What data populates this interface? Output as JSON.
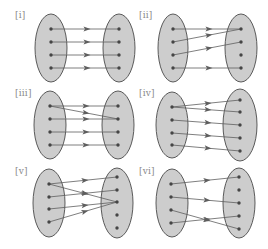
{
  "colors": {
    "background": "#ffffff",
    "ellipse_fill": "#cdcdcd",
    "ellipse_stroke": "#5a5a5a",
    "dot": "#454545",
    "line": "#5e5e5e",
    "label": "#8a8a8a"
  },
  "panels": [
    {
      "label": "[i]",
      "label_pos": [
        15,
        11
      ],
      "left_set": {
        "cx": 51,
        "cy": 48,
        "rx": 16,
        "ry": 34,
        "points": [
          [
            51,
            29
          ],
          [
            51,
            42
          ],
          [
            51,
            55
          ],
          [
            51,
            68
          ]
        ]
      },
      "right_set": {
        "cx": 119,
        "cy": 48,
        "rx": 16,
        "ry": 34,
        "points": [
          [
            119,
            29
          ],
          [
            119,
            42
          ],
          [
            119,
            55
          ],
          [
            119,
            68
          ]
        ]
      },
      "mappings": [
        [
          0,
          0
        ],
        [
          1,
          1
        ],
        [
          2,
          2
        ],
        [
          3,
          3
        ]
      ]
    },
    {
      "label": "[ii]",
      "label_pos": [
        139,
        11
      ],
      "left_set": {
        "cx": 173,
        "cy": 48,
        "rx": 15,
        "ry": 34,
        "points": [
          [
            173,
            29
          ],
          [
            173,
            42
          ],
          [
            173,
            55
          ],
          [
            173,
            68
          ]
        ]
      },
      "right_set": {
        "cx": 241,
        "cy": 48,
        "rx": 16,
        "ry": 34,
        "points": [
          [
            241,
            29
          ],
          [
            241,
            42
          ],
          [
            241,
            55
          ],
          [
            241,
            68
          ]
        ]
      },
      "mappings": [
        [
          0,
          0
        ],
        [
          1,
          0
        ],
        [
          2,
          1
        ],
        [
          3,
          3
        ]
      ]
    },
    {
      "label": "[iii]",
      "label_pos": [
        15,
        89
      ],
      "left_set": {
        "cx": 50,
        "cy": 125,
        "rx": 16,
        "ry": 34,
        "points": [
          [
            50,
            106
          ],
          [
            50,
            119
          ],
          [
            50,
            132
          ],
          [
            50,
            145
          ]
        ]
      },
      "right_set": {
        "cx": 118,
        "cy": 125,
        "rx": 16,
        "ry": 34,
        "points": [
          [
            118,
            106
          ],
          [
            118,
            119
          ],
          [
            118,
            132
          ],
          [
            118,
            145
          ]
        ]
      },
      "mappings": [
        [
          0,
          0
        ],
        [
          0,
          1
        ],
        [
          1,
          1
        ],
        [
          2,
          2
        ],
        [
          3,
          3
        ]
      ]
    },
    {
      "label": "[iv]",
      "label_pos": [
        139,
        89
      ],
      "left_set": {
        "cx": 172,
        "cy": 125,
        "rx": 16,
        "ry": 33,
        "points": [
          [
            172,
            107
          ],
          [
            172,
            120
          ],
          [
            172,
            133
          ],
          [
            172,
            145
          ]
        ]
      },
      "right_set": {
        "cx": 240,
        "cy": 125,
        "rx": 17,
        "ry": 36,
        "points": [
          [
            240,
            100
          ],
          [
            240,
            112
          ],
          [
            240,
            125
          ],
          [
            240,
            138
          ],
          [
            240,
            151
          ]
        ]
      },
      "mappings": [
        [
          0,
          0
        ],
        [
          0,
          1
        ],
        [
          1,
          2
        ],
        [
          2,
          3
        ],
        [
          3,
          4
        ]
      ]
    },
    {
      "label": "[v]",
      "label_pos": [
        15,
        167
      ],
      "left_set": {
        "cx": 49,
        "cy": 203,
        "rx": 16,
        "ry": 34,
        "points": [
          [
            49,
            184
          ],
          [
            49,
            197
          ],
          [
            49,
            209
          ],
          [
            49,
            222
          ]
        ]
      },
      "right_set": {
        "cx": 117,
        "cy": 203,
        "rx": 16,
        "ry": 35,
        "points": [
          [
            117,
            177
          ],
          [
            117,
            190
          ],
          [
            117,
            202
          ],
          [
            117,
            215
          ],
          [
            117,
            228
          ]
        ]
      },
      "mappings": [
        [
          0,
          0
        ],
        [
          0,
          2
        ],
        [
          1,
          1
        ],
        [
          2,
          2
        ],
        [
          3,
          2
        ]
      ]
    },
    {
      "label": "[vi]",
      "label_pos": [
        139,
        167
      ],
      "left_set": {
        "cx": 172,
        "cy": 203,
        "rx": 16,
        "ry": 34,
        "points": [
          [
            171,
            184
          ],
          [
            171,
            197
          ],
          [
            171,
            210
          ],
          [
            171,
            223
          ]
        ]
      },
      "right_set": {
        "cx": 239,
        "cy": 203,
        "rx": 16,
        "ry": 35,
        "points": [
          [
            239,
            177
          ],
          [
            239,
            190
          ],
          [
            239,
            203
          ],
          [
            239,
            216
          ],
          [
            239,
            229
          ]
        ]
      },
      "mappings": [
        [
          0,
          0
        ],
        [
          1,
          2
        ],
        [
          2,
          4
        ],
        [
          3,
          3
        ]
      ]
    }
  ]
}
